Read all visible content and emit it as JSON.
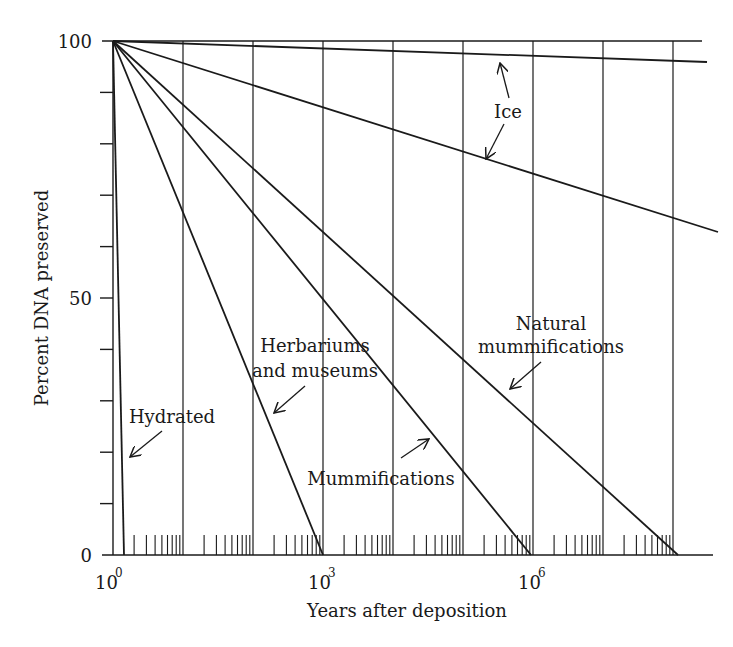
{
  "chart_data": {
    "type": "line",
    "title": "",
    "xlabel": "Years after deposition",
    "ylabel": "Percent DNA preserved",
    "xscale": "log",
    "xlim_log10": [
      0,
      8.3
    ],
    "ylim": [
      0,
      100
    ],
    "x_tick_labels": [
      {
        "base": "10",
        "exp": "0",
        "log10": 0
      },
      {
        "base": "10",
        "exp": "3",
        "log10": 3
      },
      {
        "base": "10",
        "exp": "6",
        "log10": 6
      }
    ],
    "y_tick_labels": [
      "0",
      "50",
      "100"
    ],
    "y_minor_ticks": [
      10,
      20,
      30,
      40,
      60,
      70,
      80,
      90
    ],
    "grid": {
      "vertical_at_decades": true,
      "horizontal": false
    },
    "series": [
      {
        "name": "Ice (upper)",
        "points": [
          {
            "log10_years": 0,
            "percent": 100
          },
          {
            "log10_years": 8.45,
            "percent": 96
          }
        ]
      },
      {
        "name": "Ice (lower)",
        "points": [
          {
            "log10_years": 0,
            "percent": 100
          },
          {
            "log10_years": 8.6,
            "percent": 63
          }
        ]
      },
      {
        "name": "Hydrated",
        "points": [
          {
            "log10_years": 0,
            "percent": 100
          },
          {
            "log10_years": 0.16,
            "percent": 0
          }
        ]
      },
      {
        "name": "Herbariums and museums",
        "points": [
          {
            "log10_years": 0,
            "percent": 100
          },
          {
            "log10_years": 3.0,
            "percent": 0
          }
        ]
      },
      {
        "name": "Mummifications",
        "points": [
          {
            "log10_years": 0,
            "percent": 100
          },
          {
            "log10_years": 5.97,
            "percent": 0
          }
        ]
      },
      {
        "name": "Natural mummifications",
        "points": [
          {
            "log10_years": 0,
            "percent": 100
          },
          {
            "log10_years": 8.07,
            "percent": 0
          }
        ]
      }
    ],
    "annotations": [
      {
        "text": "Ice",
        "arrows_to": [
          "Ice (upper)",
          "Ice (lower)"
        ]
      },
      {
        "text": "Hydrated",
        "arrow_to": "Hydrated"
      },
      {
        "text": "Herbariums and museums",
        "lines": [
          "Herbariums",
          "and museums"
        ],
        "arrow_to": "Herbariums and museums"
      },
      {
        "text": "Mummifications",
        "arrow_to": "Mummifications"
      },
      {
        "text": "Natural mummifications",
        "lines": [
          "Natural",
          "mummifications"
        ],
        "arrow_to": "Natural mummifications"
      }
    ]
  },
  "labels": {
    "y100": "100",
    "y50": "50",
    "y0": "0",
    "x0_base": "10",
    "x0_exp": "0",
    "x3_base": "10",
    "x3_exp": "3",
    "x6_base": "10",
    "x6_exp": "6",
    "xlabel": "Years after deposition",
    "ylabel": "Percent DNA preserved",
    "ice": "Ice",
    "hydrated": "Hydrated",
    "herb1": "Herbariums",
    "herb2": "and museums",
    "mumm": "Mummifications",
    "nat1": "Natural",
    "nat2": "mummifications"
  },
  "colors": {
    "ink": "#1a1a1a",
    "background": "#ffffff"
  }
}
